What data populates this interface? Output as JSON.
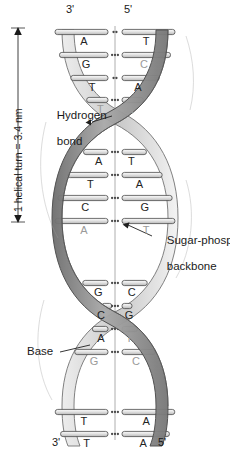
{
  "figure": {
    "type": "diagram"
  },
  "ends": {
    "top_left": "3'",
    "top_right": "5'",
    "bottom_left": "3'",
    "bottom_right": "5'"
  },
  "scale": {
    "label": "1 helical turn = 3.4 nm",
    "value": 3.4,
    "unit": "nm"
  },
  "annotations": {
    "hydrogen_bond": "Hydrogen\nbond",
    "hydrogen_bond_line1": "Hydrogen",
    "hydrogen_bond_line2": "bond",
    "sugar_phosphate": "Sugar-phosphate\nbackbone",
    "sugar_phosphate_line1": "Sugar-phosphate",
    "sugar_phosphate_line2": "backbone",
    "base": "Base"
  },
  "colors": {
    "ribbon_dark": "#8d8d8d",
    "ribbon_light": "#d8d8d8",
    "ribbon_edge": "#5a5a5a",
    "base_bar": "#e9e9e9",
    "base_bar_edge": "#4a4a4a",
    "hbond_dot": "#4a4a4a",
    "text": "#1a1a1a",
    "axis": "#8a8a8a",
    "background": "#ffffff"
  },
  "base_pairs": [
    {
      "index": 1,
      "y": 32,
      "left": "A",
      "right": "T",
      "bonds": 2,
      "dim_left": false,
      "dim_right": false
    },
    {
      "index": 2,
      "y": 55,
      "left": "G",
      "right": "C",
      "bonds": 3,
      "dim_left": false,
      "dim_right": true
    },
    {
      "index": 3,
      "y": 78,
      "left": "T",
      "right": "A",
      "bonds": 2,
      "dim_left": false,
      "dim_right": false
    },
    {
      "index": 4,
      "y": 100,
      "left": "T",
      "right": "A",
      "bonds": 3,
      "dim_left": true,
      "dim_right": true
    },
    {
      "index": 5,
      "y": 152,
      "left": "A",
      "right": "T",
      "bonds": 3,
      "dim_left": false,
      "dim_right": false
    },
    {
      "index": 6,
      "y": 175,
      "left": "T",
      "right": "A",
      "bonds": 3,
      "dim_left": false,
      "dim_right": false
    },
    {
      "index": 7,
      "y": 198,
      "left": "C",
      "right": "G",
      "bonds": 3,
      "dim_left": false,
      "dim_right": false
    },
    {
      "index": 8,
      "y": 221,
      "left": "A",
      "right": "T",
      "bonds": 3,
      "dim_left": true,
      "dim_right": true
    },
    {
      "index": 9,
      "y": 283,
      "left": "G",
      "right": "C",
      "bonds": 3,
      "dim_left": false,
      "dim_right": false
    },
    {
      "index": 10,
      "y": 306,
      "left": "C",
      "right": "G",
      "bonds": 3,
      "dim_left": false,
      "dim_right": false
    },
    {
      "index": 11,
      "y": 329,
      "left": "A",
      "right": "T",
      "bonds": 3,
      "dim_left": false,
      "dim_right": true
    },
    {
      "index": 12,
      "y": 352,
      "left": "G",
      "right": "C",
      "bonds": 3,
      "dim_left": true,
      "dim_right": true
    },
    {
      "index": 13,
      "y": 412,
      "left": "T",
      "right": "A",
      "bonds": 3,
      "dim_left": false,
      "dim_right": false
    },
    {
      "index": 14,
      "y": 434,
      "left": "T",
      "right": "A",
      "bonds": 3,
      "dim_left": false,
      "dim_right": false
    }
  ],
  "strands": {
    "count": 2,
    "names": [
      "left-backbone-strand",
      "right-backbone-strand"
    ],
    "direction_left": "3' to 3'",
    "direction_right": "5' to 5'"
  }
}
